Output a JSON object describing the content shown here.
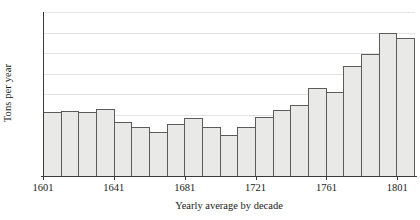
{
  "chart_data": {
    "type": "bar",
    "title": "",
    "subtitle": "",
    "xlabel": "Yearly average by decade",
    "ylabel": "Tons per year",
    "ylim": [
      0,
      800
    ],
    "ytick_values": [
      0,
      100,
      200,
      300,
      400,
      500,
      600,
      700,
      800
    ],
    "ytick_labels": [
      "0",
      "100",
      "200",
      "300",
      "400",
      "500",
      "600",
      "700",
      "800"
    ],
    "xtick_labels": [
      "1601",
      "1641",
      "1681",
      "1721",
      "1761",
      "1801"
    ],
    "xtick_decades": [
      1601,
      1641,
      1681,
      1721,
      1761,
      1801
    ],
    "grid": true,
    "grid_axis": "y",
    "legend": null,
    "bar_count": 21,
    "categories": [
      "1601",
      "1611",
      "1621",
      "1631",
      "1641",
      "1651",
      "1661",
      "1671",
      "1681",
      "1691",
      "1701",
      "1711",
      "1721",
      "1731",
      "1741",
      "1751",
      "1761",
      "1771",
      "1781",
      "1791",
      "1801"
    ],
    "values": [
      312,
      315,
      312,
      325,
      262,
      237,
      215,
      253,
      283,
      238,
      202,
      237,
      290,
      320,
      345,
      430,
      408,
      535,
      595,
      700,
      675
    ],
    "colors": {
      "bar_fill": "#e9e9e7",
      "bar_edge": "#5b5b5b",
      "gridline": "#e3e3e3",
      "axis": "#3a3a3a",
      "text": "#1a1a1a",
      "background": "#ffffff"
    }
  }
}
